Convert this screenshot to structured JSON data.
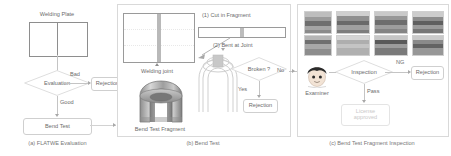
{
  "figure": {
    "title_hidden": "",
    "panels": [
      {
        "id": "a",
        "caption": "(a) FLATWE Evaluation",
        "nodes": {
          "welding_plate_label": "Welding Plate",
          "evaluation": "Evaluation",
          "rejection": "Rejection",
          "bend_test": "Bend Test"
        },
        "edges": {
          "bad": "Bad",
          "good": "Good"
        }
      },
      {
        "id": "b",
        "caption": "(b) Bend Test",
        "nodes": {
          "welding_joint_label": "Welding joint",
          "bend_test_fragment_label": "Bend Test Fragment",
          "step1": "(1) Cut in Fragment",
          "step2": "(2) Bent at Joint",
          "broken": "Broken ?",
          "rejection": "Rejection"
        },
        "edges": {
          "yes": "Yes",
          "no": "No"
        }
      },
      {
        "id": "c",
        "caption": "(c) Bend Test Fragment Inspection",
        "nodes": {
          "examiner": "Examiner",
          "inspection": "Inspection",
          "rejection": "Rejection",
          "license_approved": "License\napproved"
        },
        "edges": {
          "ng": "NG",
          "pass": "Pass"
        },
        "thumbnail_grid": {
          "rows": 2,
          "cols": 4,
          "description_hidden": ""
        }
      }
    ],
    "colors": {
      "panel_border": "#d9d9d9",
      "line": "#c4c4c4",
      "text": "#6b6b6b",
      "ghost_text": "#c9c9c9",
      "plate_border": "#8e8e8e",
      "seam": "#b9b9b9"
    }
  }
}
